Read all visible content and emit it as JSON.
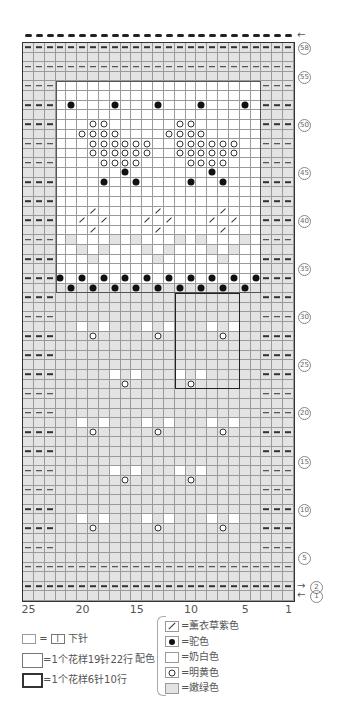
{
  "chart_title": "",
  "grid": {
    "columns": 25,
    "rows": 58,
    "column_labels": [
      {
        "col": 25,
        "text": "25"
      },
      {
        "col": 20,
        "text": "20"
      },
      {
        "col": 15,
        "text": "15"
      },
      {
        "col": 10,
        "text": "10"
      },
      {
        "col": 5,
        "text": "5"
      },
      {
        "col": 1,
        "text": "1"
      }
    ],
    "row_labels": [
      {
        "row": 58,
        "text": "58"
      },
      {
        "row": 55,
        "text": "55"
      },
      {
        "row": 50,
        "text": "50"
      },
      {
        "row": 45,
        "text": "45"
      },
      {
        "row": 40,
        "text": "40"
      },
      {
        "row": 35,
        "text": "35"
      },
      {
        "row": 30,
        "text": "30"
      },
      {
        "row": 25,
        "text": "25"
      },
      {
        "row": 20,
        "text": "20"
      },
      {
        "row": 15,
        "text": "15"
      },
      {
        "row": 10,
        "text": "10"
      },
      {
        "row": 5,
        "text": "5"
      },
      {
        "row": 2,
        "text": "2",
        "arrow": "→"
      },
      {
        "row": 1,
        "text": "1",
        "arrow": "←"
      }
    ],
    "top_arrow": "←",
    "white_region": {
      "col_from": 22,
      "col_to": 4,
      "row_from": 34,
      "row_to": 54
    },
    "pattern_repeat_19x22": {
      "col_from": 22,
      "col_to": 4,
      "row_from": 33,
      "row_to": 54
    },
    "pattern_repeat_6x10": {
      "col_from": 11,
      "col_to": 6,
      "row_from": 23,
      "row_to": 32
    },
    "purl_full_rows": [
      58,
      56,
      4,
      2
    ],
    "purl_side_rows_even_from": 6,
    "purl_side_rows_even_to": 54,
    "purl_side_cols": [
      25,
      24,
      23,
      3,
      2,
      1
    ],
    "dots": [
      [
        52,
        21
      ],
      [
        52,
        17
      ],
      [
        52,
        13
      ],
      [
        52,
        9
      ],
      [
        52,
        5
      ],
      [
        45,
        16
      ],
      [
        45,
        8
      ],
      [
        44,
        18
      ],
      [
        44,
        15
      ],
      [
        44,
        10
      ],
      [
        44,
        7
      ],
      [
        34,
        22
      ],
      [
        34,
        20
      ],
      [
        34,
        18
      ],
      [
        34,
        16
      ],
      [
        34,
        14
      ],
      [
        34,
        12
      ],
      [
        34,
        10
      ],
      [
        34,
        8
      ],
      [
        34,
        6
      ],
      [
        34,
        4
      ],
      [
        33,
        21
      ],
      [
        33,
        19
      ],
      [
        33,
        17
      ],
      [
        33,
        15
      ],
      [
        33,
        13
      ],
      [
        33,
        11
      ],
      [
        33,
        9
      ],
      [
        33,
        7
      ],
      [
        33,
        5
      ]
    ],
    "rings": [
      [
        50,
        19
      ],
      [
        50,
        18
      ],
      [
        50,
        11
      ],
      [
        50,
        10
      ],
      [
        49,
        20
      ],
      [
        49,
        19
      ],
      [
        49,
        18
      ],
      [
        49,
        17
      ],
      [
        49,
        12
      ],
      [
        49,
        11
      ],
      [
        49,
        10
      ],
      [
        49,
        9
      ],
      [
        48,
        19
      ],
      [
        48,
        18
      ],
      [
        48,
        17
      ],
      [
        48,
        16
      ],
      [
        48,
        15
      ],
      [
        48,
        14
      ],
      [
        48,
        11
      ],
      [
        48,
        10
      ],
      [
        48,
        9
      ],
      [
        48,
        8
      ],
      [
        48,
        7
      ],
      [
        48,
        6
      ],
      [
        47,
        19
      ],
      [
        47,
        18
      ],
      [
        47,
        17
      ],
      [
        47,
        16
      ],
      [
        47,
        15
      ],
      [
        47,
        14
      ],
      [
        47,
        11
      ],
      [
        47,
        10
      ],
      [
        47,
        9
      ],
      [
        47,
        8
      ],
      [
        47,
        7
      ],
      [
        47,
        6
      ],
      [
        46,
        18
      ],
      [
        46,
        17
      ],
      [
        46,
        16
      ],
      [
        46,
        15
      ],
      [
        46,
        10
      ],
      [
        46,
        9
      ],
      [
        46,
        8
      ],
      [
        46,
        7
      ],
      [
        28,
        19
      ],
      [
        28,
        13
      ],
      [
        28,
        7
      ],
      [
        23,
        16
      ],
      [
        23,
        10
      ],
      [
        18,
        19
      ],
      [
        18,
        13
      ],
      [
        18,
        7
      ],
      [
        13,
        16
      ],
      [
        13,
        10
      ],
      [
        8,
        19
      ],
      [
        8,
        13
      ],
      [
        8,
        7
      ]
    ],
    "diagonals": [
      [
        41,
        19
      ],
      [
        41,
        13
      ],
      [
        41,
        7
      ],
      [
        40,
        20
      ],
      [
        40,
        18
      ],
      [
        40,
        14
      ],
      [
        40,
        12
      ],
      [
        40,
        8
      ],
      [
        40,
        6
      ],
      [
        39,
        19
      ],
      [
        39,
        13
      ],
      [
        39,
        7
      ]
    ],
    "green_in_white": [
      [
        38,
        21
      ],
      [
        38,
        17
      ],
      [
        38,
        15
      ],
      [
        38,
        11
      ],
      [
        38,
        9
      ],
      [
        38,
        5
      ],
      [
        37,
        20
      ],
      [
        37,
        18
      ],
      [
        37,
        14
      ],
      [
        37,
        12
      ],
      [
        37,
        8
      ],
      [
        37,
        6
      ],
      [
        36,
        19
      ],
      [
        36,
        13
      ],
      [
        36,
        7
      ]
    ],
    "white_in_green": [
      [
        29,
        20
      ],
      [
        29,
        18
      ],
      [
        29,
        14
      ],
      [
        29,
        12
      ],
      [
        29,
        8
      ],
      [
        29,
        6
      ],
      [
        24,
        17
      ],
      [
        24,
        15
      ],
      [
        24,
        11
      ],
      [
        24,
        9
      ],
      [
        19,
        20
      ],
      [
        19,
        18
      ],
      [
        19,
        14
      ],
      [
        19,
        12
      ],
      [
        19,
        8
      ],
      [
        19,
        6
      ],
      [
        14,
        17
      ],
      [
        14,
        15
      ],
      [
        14,
        11
      ],
      [
        14,
        9
      ],
      [
        9,
        20
      ],
      [
        9,
        18
      ],
      [
        9,
        14
      ],
      [
        9,
        12
      ],
      [
        9,
        8
      ],
      [
        9,
        6
      ]
    ]
  },
  "legend": {
    "purl": {
      "eq": "=",
      "symbol": "I",
      "label": "下针"
    },
    "repeat_19x22": "=1个花样19针22行",
    "repeat_6x10": "=1个花样6针10行",
    "color_title": "配色",
    "colors": [
      {
        "symbol": "diagonal",
        "label": "=薰衣草紫色"
      },
      {
        "symbol": "dot",
        "label": "=驼色"
      },
      {
        "symbol": "blank",
        "label": "=奶白色"
      },
      {
        "symbol": "ring",
        "label": "=明黄色"
      },
      {
        "symbol": "green",
        "label": "=嫩绿色"
      }
    ]
  },
  "colors": {
    "green_cell": "#e3e3e3",
    "white_cell": "#ffffff",
    "grid_line": "#9a9a9a",
    "ink": "#222222"
  }
}
